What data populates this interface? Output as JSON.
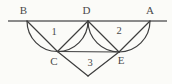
{
  "diagram": {
    "vertices": {
      "b": "B",
      "d": "D",
      "a": "A",
      "c": "C",
      "e": "E"
    },
    "regions": {
      "r1": "1",
      "r2": "2",
      "r3": "3"
    },
    "colors": {
      "stroke": "#3e3e3e",
      "baseline": "#8a8a8a",
      "label": "#4a4a4a",
      "background": "#fbfbf8"
    }
  }
}
